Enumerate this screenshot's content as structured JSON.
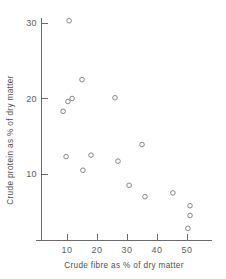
{
  "chart_data": {
    "type": "scatter",
    "title": "",
    "xlabel": "Crude fibre as % of dry matter",
    "ylabel": "Crude protein as % of dry matter",
    "xlim": [
      0,
      58
    ],
    "ylim": [
      0,
      32
    ],
    "xticks": [
      10,
      20,
      30,
      40,
      50
    ],
    "yticks": [
      10,
      20,
      30
    ],
    "xtick_labels": [
      "10",
      "20",
      "30",
      "40",
      "50"
    ],
    "ytick_labels": [
      "10",
      "20",
      "30"
    ],
    "grid": false,
    "legend": false,
    "marker": "open-circle",
    "marker_color": "#7a7a7a",
    "points": [
      {
        "x": 10.7,
        "y": 30.3
      },
      {
        "x": 15.0,
        "y": 22.5
      },
      {
        "x": 11.7,
        "y": 20.0
      },
      {
        "x": 10.3,
        "y": 19.6
      },
      {
        "x": 8.7,
        "y": 18.3
      },
      {
        "x": 26.0,
        "y": 20.1
      },
      {
        "x": 35.0,
        "y": 13.9
      },
      {
        "x": 9.7,
        "y": 12.3
      },
      {
        "x": 18.0,
        "y": 12.5
      },
      {
        "x": 27.0,
        "y": 11.7
      },
      {
        "x": 15.3,
        "y": 10.5
      },
      {
        "x": 30.7,
        "y": 8.5
      },
      {
        "x": 36.0,
        "y": 7.0
      },
      {
        "x": 45.3,
        "y": 7.5
      },
      {
        "x": 51.0,
        "y": 5.8
      },
      {
        "x": 51.0,
        "y": 4.5
      },
      {
        "x": 50.3,
        "y": 2.8
      }
    ]
  },
  "axes": {
    "x_axis_name": "x-axis",
    "y_axis_name": "y-axis"
  }
}
